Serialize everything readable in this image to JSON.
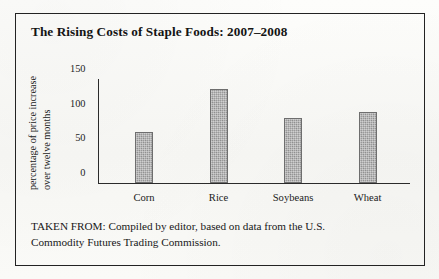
{
  "figure": {
    "title": "The Rising Costs of Staple Foods: 2007–2008",
    "source_note_line1": "TAKEN FROM: Compiled by editor, based on data from the U.S.",
    "source_note_line2": "Commodity Futures Trading Commission.",
    "frame_color": "#232323",
    "paper_color": "#fbfbf9",
    "bar_fill_color": "#9a9a9a",
    "bar_outline_color": "#6e6e6e"
  },
  "chart_data": {
    "type": "bar",
    "title": "The Rising Costs of Staple Foods: 2007–2008",
    "categories": [
      "Corn",
      "Rice",
      "Soybeans",
      "Wheat"
    ],
    "values": [
      74,
      135,
      94,
      103
    ],
    "xlabel": "",
    "ylabel": "percentage of price increase over twelve months",
    "ylabel_line1": "percentage of price increase",
    "ylabel_line2": "over twelve months",
    "ylim": [
      0,
      150
    ],
    "yticks": [
      0,
      50,
      100,
      150
    ],
    "ytick_labels": [
      "0",
      "50",
      "100",
      "150"
    ],
    "grid": false,
    "legend": false
  }
}
